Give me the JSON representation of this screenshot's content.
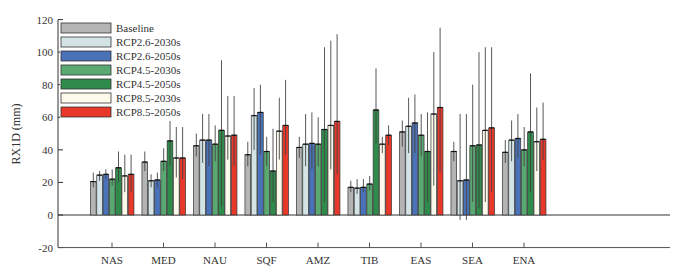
{
  "chart_data": {
    "type": "bar",
    "title": "",
    "xlabel": "",
    "ylabel": "RX1D (mm)",
    "ylim": [
      -20,
      120
    ],
    "yticks": [
      -20,
      0,
      20,
      40,
      60,
      80,
      100,
      120
    ],
    "grid": false,
    "legend_position": "upper-left",
    "categories": [
      "NAS",
      "MED",
      "NAU",
      "SQF",
      "AMZ",
      "TIB",
      "EAS",
      "SEA",
      "ENA"
    ],
    "series": [
      {
        "name": "Baseline",
        "color": "#b4b4b4",
        "values": [
          20.5,
          32.5,
          42.5,
          37,
          41.5,
          17,
          51,
          39,
          38.5
        ],
        "err_low": [
          17,
          27,
          36,
          30,
          35,
          14,
          42,
          33,
          32
        ],
        "err_high": [
          26,
          39,
          50,
          45,
          48,
          21,
          58,
          45,
          46
        ]
      },
      {
        "name": "RCP2.6-2030s",
        "color": "#d4e3e6",
        "values": [
          24.5,
          21,
          46,
          61,
          43.5,
          16.5,
          54.5,
          21,
          46
        ],
        "err_low": [
          21,
          17,
          32,
          40,
          30,
          13,
          38,
          -3,
          33
        ],
        "err_high": [
          27,
          25,
          62,
          78,
          62,
          22,
          72,
          62,
          58
        ]
      },
      {
        "name": "RCP2.6-2050s",
        "color": "#4a72b8",
        "values": [
          25,
          21.5,
          46,
          63,
          44,
          17,
          56.5,
          21.5,
          47
        ],
        "err_low": [
          22,
          17,
          30,
          37,
          28,
          14,
          38,
          -3,
          35
        ],
        "err_high": [
          28,
          26,
          62,
          80,
          63,
          22,
          74,
          62,
          62
        ]
      },
      {
        "name": "RCP4.5-2030s",
        "color": "#5aa872",
        "values": [
          22,
          33,
          43.5,
          39,
          43.5,
          19,
          49,
          42.5,
          40
        ],
        "err_low": [
          18,
          27,
          33,
          30,
          30,
          15,
          36,
          8,
          30
        ],
        "err_high": [
          28,
          41,
          55,
          48,
          60,
          24,
          62,
          80,
          54
        ]
      },
      {
        "name": "RCP4.5-2050s",
        "color": "#2e8b4a",
        "values": [
          29,
          45.5,
          52,
          27,
          52.5,
          64.5,
          39,
          43,
          51
        ],
        "err_low": [
          20,
          30,
          5,
          8,
          8,
          44,
          8,
          4,
          14
        ],
        "err_high": [
          39,
          58,
          95,
          53,
          103,
          90,
          63,
          100,
          87
        ]
      },
      {
        "name": "RCP8.5-2030s",
        "color": "#fdfaec",
        "values": [
          24,
          35,
          48.5,
          51.5,
          55,
          43.5,
          62,
          52,
          45
        ],
        "err_low": [
          14,
          23,
          34,
          34,
          28,
          38,
          18,
          8,
          27
        ],
        "err_high": [
          37,
          54,
          73,
          72,
          107,
          48,
          100,
          103,
          66
        ]
      },
      {
        "name": "RCP8.5-2050s",
        "color": "#e8382a",
        "values": [
          25,
          35,
          49,
          55,
          57.5,
          49,
          66,
          53.5,
          46.5
        ],
        "err_low": [
          14,
          22,
          30,
          37,
          25,
          43,
          26,
          14,
          34
        ],
        "err_high": [
          37,
          54,
          73,
          83,
          111,
          55,
          115,
          103,
          69
        ]
      }
    ]
  }
}
